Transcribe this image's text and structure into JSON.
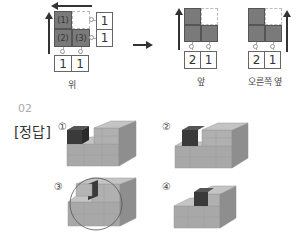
{
  "top_diagram": {
    "top_view": {
      "caption": "위",
      "cells": [
        "(1)",
        "(2)",
        "(3)"
      ],
      "right_counts": [
        "1",
        "1"
      ],
      "bottom_counts": [
        "1",
        "1"
      ]
    },
    "front_view": {
      "caption": "앞",
      "bottom_counts": [
        "2",
        "1"
      ]
    },
    "right_view": {
      "caption": "오른쪽 옆",
      "bottom_counts": [
        "2",
        "1"
      ]
    }
  },
  "section": {
    "number": "02",
    "answer_label": "[정답]",
    "options": [
      {
        "marker": "①"
      },
      {
        "marker": "②"
      },
      {
        "marker": "③",
        "circled": true
      },
      {
        "marker": "④"
      }
    ]
  },
  "colors": {
    "dark_cube": "#3a3a3a",
    "gray_cube": "#a8a8a8",
    "grid_dark": "#7a7a7a"
  }
}
